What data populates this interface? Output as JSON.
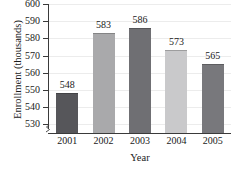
{
  "chart_data": {
    "type": "bar",
    "title": "",
    "xlabel": "Year",
    "ylabel": "Enrollment (thousands)",
    "categories": [
      "2001",
      "2002",
      "2003",
      "2004",
      "2005"
    ],
    "values": [
      548,
      583,
      586,
      573,
      565
    ],
    "value_labels": [
      "548",
      "583",
      "586",
      "573",
      "565"
    ],
    "ylim": [
      525,
      600
    ],
    "yticks": [
      530,
      540,
      550,
      560,
      570,
      580,
      590,
      600
    ],
    "ytick_labels": [
      "530",
      "540",
      "550",
      "560",
      "570",
      "580",
      "590",
      "600"
    ],
    "axis_break": true,
    "grid": "horizontal",
    "legend": "none",
    "bar_colors": [
      "#56565a",
      "#a9a9ab",
      "#6f6f73",
      "#c9c9cb",
      "#78787c"
    ]
  }
}
